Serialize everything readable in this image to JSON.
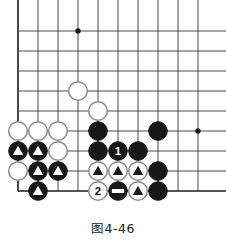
{
  "figure": {
    "caption": "图4-46",
    "kind": "go-board-diagram"
  },
  "board": {
    "grid": {
      "cols": 10,
      "rows": 9,
      "spacing": 20,
      "origin_x": 18,
      "origin_y": 31,
      "line_color": "#4a4a4a",
      "edge_color": "#1a1a1a",
      "background": "#ffffff"
    },
    "star_points": [
      {
        "c": 3,
        "r": 0
      },
      {
        "c": 9,
        "r": 5
      }
    ],
    "edges": {
      "left": true,
      "bottom": true,
      "top": false,
      "right": false
    },
    "colors": {
      "black_stone": "#181818",
      "white_stone": "#ffffff",
      "white_stone_border": "#8c8c8c",
      "marker_on_black": "#ffffff",
      "marker_on_white": "#181818"
    },
    "stones": [
      {
        "c": 3,
        "r": 3,
        "color": "white",
        "mark": "none",
        "label": ""
      },
      {
        "c": 4,
        "r": 4,
        "color": "white",
        "mark": "none",
        "label": ""
      },
      {
        "c": 0,
        "r": 5,
        "color": "white",
        "mark": "none",
        "label": ""
      },
      {
        "c": 1,
        "r": 5,
        "color": "white",
        "mark": "none",
        "label": ""
      },
      {
        "c": 2,
        "r": 5,
        "color": "white",
        "mark": "none",
        "label": ""
      },
      {
        "c": 4,
        "r": 5,
        "color": "black",
        "mark": "none",
        "label": ""
      },
      {
        "c": 7,
        "r": 5,
        "color": "black",
        "mark": "none",
        "label": ""
      },
      {
        "c": 0,
        "r": 6,
        "color": "black",
        "mark": "triangle",
        "label": ""
      },
      {
        "c": 1,
        "r": 6,
        "color": "black",
        "mark": "triangle",
        "label": ""
      },
      {
        "c": 2,
        "r": 6,
        "color": "white",
        "mark": "none",
        "label": ""
      },
      {
        "c": 4,
        "r": 6,
        "color": "black",
        "mark": "none",
        "label": ""
      },
      {
        "c": 5,
        "r": 6,
        "color": "black",
        "mark": "none",
        "label": "1"
      },
      {
        "c": 6,
        "r": 6,
        "color": "black",
        "mark": "none",
        "label": ""
      },
      {
        "c": 0,
        "r": 7,
        "color": "white",
        "mark": "none",
        "label": ""
      },
      {
        "c": 1,
        "r": 7,
        "color": "black",
        "mark": "triangle",
        "label": ""
      },
      {
        "c": 2,
        "r": 7,
        "color": "black",
        "mark": "triangle",
        "label": ""
      },
      {
        "c": 4,
        "r": 7,
        "color": "white",
        "mark": "triangle",
        "label": ""
      },
      {
        "c": 5,
        "r": 7,
        "color": "white",
        "mark": "triangle",
        "label": ""
      },
      {
        "c": 6,
        "r": 7,
        "color": "white",
        "mark": "triangle",
        "label": ""
      },
      {
        "c": 7,
        "r": 7,
        "color": "black",
        "mark": "none",
        "label": ""
      },
      {
        "c": 1,
        "r": 8,
        "color": "black",
        "mark": "triangle",
        "label": ""
      },
      {
        "c": 4,
        "r": 8,
        "color": "white",
        "mark": "none",
        "label": "2"
      },
      {
        "c": 5,
        "r": 8,
        "color": "black",
        "mark": "bar",
        "label": ""
      },
      {
        "c": 6,
        "r": 8,
        "color": "white",
        "mark": "triangle",
        "label": ""
      },
      {
        "c": 7,
        "r": 8,
        "color": "black",
        "mark": "none",
        "label": ""
      }
    ]
  }
}
